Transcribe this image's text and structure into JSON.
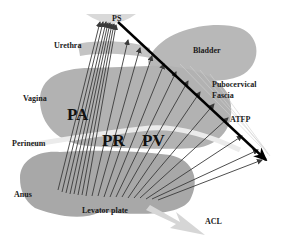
{
  "diagram": {
    "type": "anatomical-force-diagram",
    "colors": {
      "organ": "#b4b4b4",
      "organ_light": "#c8c8c8",
      "arrow_thin": "#3a3a3a",
      "arrow_main": "#000000",
      "acl_arrow": "#d4d4d4",
      "background": "#ffffff"
    },
    "labels": {
      "ps": "PS",
      "urethra": "Urethra",
      "bladder": "Bladder",
      "vagina": "Vagina",
      "pubocervical_1": "Pubocervical",
      "pubocervical_2": "Fascia",
      "atfp": "ATFP",
      "perineum": "Perineum",
      "anus": "Anus",
      "levator_plate": "Levator plate",
      "acl": "ACL",
      "pa": "PA",
      "pr": "PR",
      "pv": "PV"
    }
  }
}
